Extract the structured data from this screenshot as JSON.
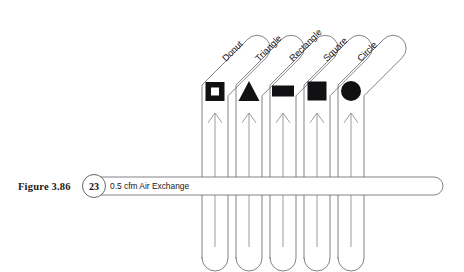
{
  "figure": {
    "caption": "Figure 3.86",
    "badge_number": "23",
    "pipe_label": "0.5 cfm Air Exchange"
  },
  "colors": {
    "background": "#ffffff",
    "tube_stroke": "#6e6e72",
    "arrow_stroke": "#8b8b90",
    "glyph_fill": "#111114",
    "text": "#16161a"
  },
  "header_pipe": {
    "name": "air-exchange-supply-pipe",
    "badge": "23",
    "label": "0.5 cfm Air Exchange"
  },
  "tubes": [
    {
      "label": "Donut",
      "shape": "donut",
      "icon_name": "donut-shape-icon",
      "arrow_name": "airflow-arrow-donut",
      "center_x": 215,
      "diagonal_end_x": 280
    },
    {
      "label": "Triangle",
      "shape": "triangle",
      "icon_name": "triangle-shape-icon",
      "arrow_name": "airflow-arrow-triangle",
      "center_x": 249,
      "diagonal_end_x": 314
    },
    {
      "label": "Rectangle",
      "shape": "rectangle",
      "icon_name": "rectangle-shape-icon",
      "arrow_name": "airflow-arrow-rectangle",
      "center_x": 283,
      "diagonal_end_x": 348
    },
    {
      "label": "Square",
      "shape": "square",
      "icon_name": "square-shape-icon",
      "arrow_name": "airflow-arrow-square",
      "center_x": 317,
      "diagonal_end_x": 382
    },
    {
      "label": "Circle",
      "shape": "circle",
      "icon_name": "circle-shape-icon",
      "arrow_name": "airflow-arrow-circle",
      "center_x": 351,
      "diagonal_end_x": 416
    }
  ],
  "geometry": {
    "tube_half_width": 13,
    "tube_bottom_y": 258,
    "tube_bend_y": 72,
    "pipe_y": 186,
    "pipe_half_height": 9,
    "pipe_left_x": 92,
    "pipe_right_x": 443
  }
}
